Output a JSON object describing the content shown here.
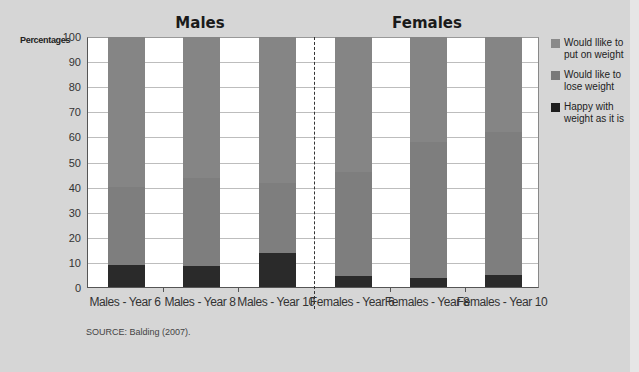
{
  "chart_data": {
    "type": "bar",
    "stacked": true,
    "title": "",
    "group_titles": [
      "Males",
      "Females"
    ],
    "ylabel": "Percentages",
    "xlabel": "",
    "ylim": [
      0,
      100
    ],
    "yticks": [
      0,
      10,
      20,
      30,
      40,
      50,
      60,
      70,
      80,
      90,
      100
    ],
    "grid": true,
    "legend_position": "right",
    "categories": [
      "Males - Year 6",
      "Males - Year 8",
      "Males - Year 10",
      "Females - Year 6",
      "Females - Year 8",
      "Females - Year 10"
    ],
    "series": [
      {
        "name": "Happy with weight as it is",
        "color": "#2a2a2a",
        "values": [
          9,
          8.5,
          13.5,
          4.5,
          3.5,
          5
        ]
      },
      {
        "name": "Would like to lose weight",
        "color": "#7e7e7e",
        "values": [
          31,
          35,
          28,
          41.5,
          54.5,
          57
        ]
      },
      {
        "name": "Would llike to put on weight",
        "color": "#858585",
        "values": [
          60,
          56.5,
          58.5,
          54,
          42,
          38
        ]
      }
    ],
    "annotations": [
      "Dashed divider between Males and Females groups"
    ]
  },
  "titles": {
    "males": "Males",
    "females": "Females"
  },
  "axis": {
    "y_title": "Percentages"
  },
  "legend": [
    {
      "label": "Would llike to put on weight",
      "color": "#8a8a8a"
    },
    {
      "label": "Would like to lose weight",
      "color": "#7a7a7a"
    },
    {
      "label": "Happy with weight as it is",
      "color": "#1e1e1e"
    }
  ],
  "source": "SOURCE: Balding (2007)."
}
